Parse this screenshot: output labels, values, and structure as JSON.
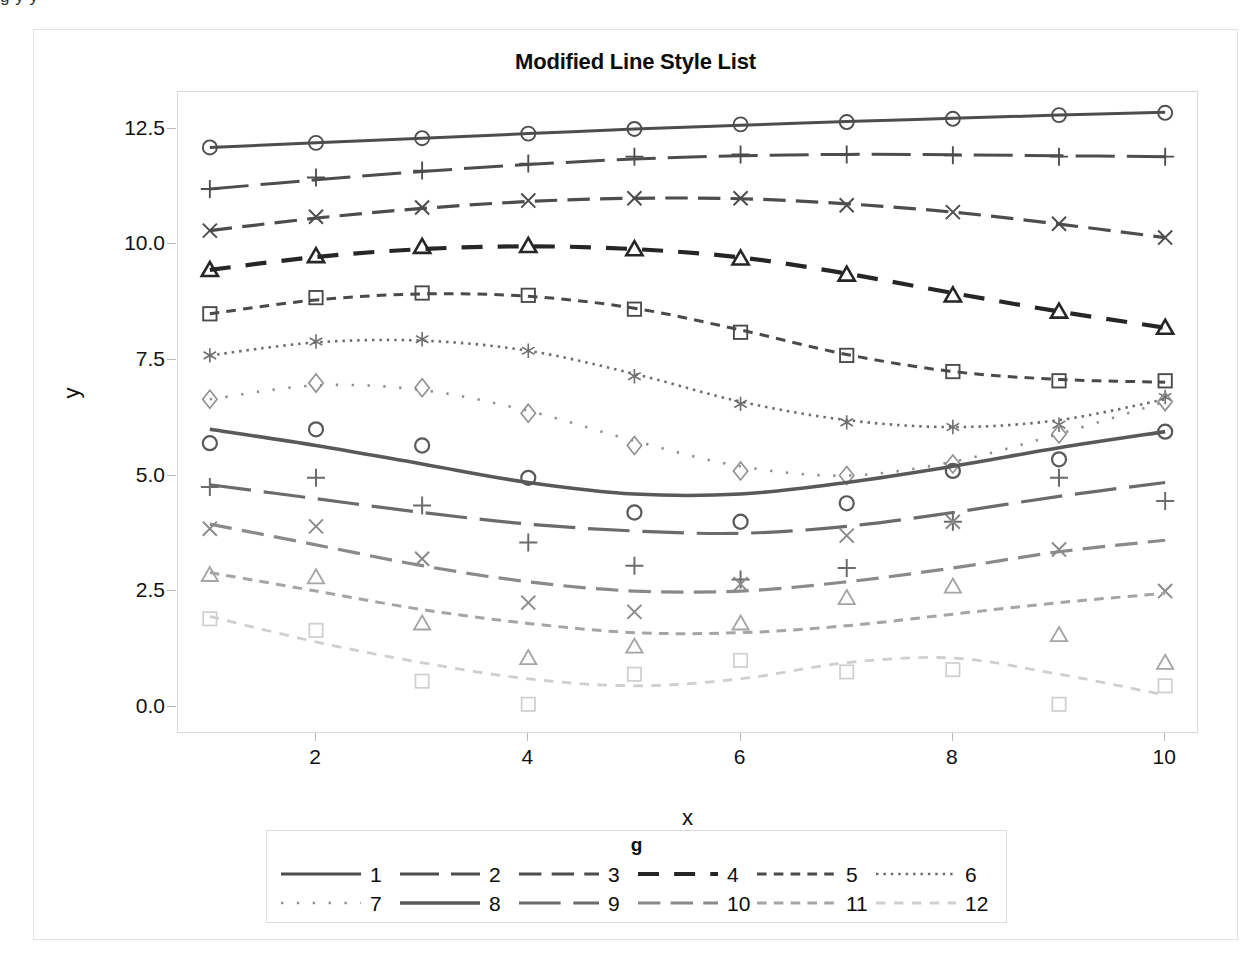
{
  "top_clipped_text": "g            y            y",
  "figure": {
    "title": "Modified Line Style List",
    "xlabel": "x",
    "ylabel": "y"
  },
  "legend": {
    "title": "g"
  },
  "chart_data": {
    "type": "line",
    "title": "Modified Line Style List",
    "xlabel": "x",
    "ylabel": "y",
    "xlim": [
      0.7,
      10.3
    ],
    "ylim": [
      -0.55,
      13.3
    ],
    "xticks": [
      2,
      4,
      6,
      8,
      10
    ],
    "yticks": [
      "0.0",
      "2.5",
      "5.0",
      "7.5",
      "10.0",
      "12.5"
    ],
    "ytick_values": [
      0.0,
      2.5,
      5.0,
      7.5,
      10.0,
      12.5
    ],
    "grid": false,
    "legend_position": "bottom",
    "legend_title": "g",
    "legend_columns": 6,
    "x": [
      1,
      2,
      3,
      4,
      5,
      6,
      7,
      8,
      9,
      10
    ],
    "series": [
      {
        "name": "1",
        "style": "solid",
        "marker": "circle",
        "color": "#4d4d4d",
        "width": 3.0,
        "values": [
          12.1,
          12.2,
          12.3,
          12.4,
          12.5,
          12.6,
          12.65,
          12.72,
          12.8,
          12.85
        ],
        "fit": [
          12.1,
          12.2,
          12.3,
          12.4,
          12.5,
          12.58,
          12.66,
          12.73,
          12.8,
          12.86
        ]
      },
      {
        "name": "2",
        "style": "longdash",
        "marker": "plus",
        "color": "#4d4d4d",
        "width": 3.0,
        "values": [
          11.2,
          11.45,
          11.6,
          11.75,
          11.9,
          11.95,
          11.95,
          11.93,
          11.9,
          11.9
        ],
        "fit": [
          11.2,
          11.4,
          11.58,
          11.73,
          11.85,
          11.92,
          11.95,
          11.94,
          11.92,
          11.9
        ]
      },
      {
        "name": "3",
        "style": "dash",
        "marker": "x",
        "color": "#4d4d4d",
        "width": 3.2,
        "values": [
          10.3,
          10.6,
          10.8,
          10.95,
          11.0,
          11.0,
          10.85,
          10.7,
          10.45,
          10.15
        ],
        "fit": [
          10.3,
          10.57,
          10.78,
          10.93,
          11.0,
          10.99,
          10.88,
          10.7,
          10.44,
          10.15
        ]
      },
      {
        "name": "4",
        "style": "dashlong",
        "marker": "triangle",
        "color": "#262626",
        "width": 4.2,
        "values": [
          9.45,
          9.75,
          9.95,
          9.97,
          9.9,
          9.7,
          9.35,
          8.9,
          8.55,
          8.2
        ],
        "fit": [
          9.45,
          9.73,
          9.9,
          9.96,
          9.9,
          9.72,
          9.37,
          8.95,
          8.55,
          8.2
        ]
      },
      {
        "name": "5",
        "style": "shortdash",
        "marker": "square",
        "color": "#4a4a4a",
        "width": 3.0,
        "values": [
          8.5,
          8.85,
          8.95,
          8.9,
          8.6,
          8.1,
          7.6,
          7.25,
          7.05,
          7.05
        ],
        "fit": [
          8.5,
          8.8,
          8.93,
          8.88,
          8.62,
          8.15,
          7.62,
          7.25,
          7.08,
          7.02
        ]
      },
      {
        "name": "6",
        "style": "dot",
        "marker": "asterisk",
        "color": "#6e6e6e",
        "width": 2.6,
        "values": [
          7.6,
          7.9,
          7.95,
          7.7,
          7.15,
          6.55,
          6.15,
          6.05,
          6.1,
          6.7
        ],
        "fit": [
          7.6,
          7.88,
          7.92,
          7.7,
          7.2,
          6.6,
          6.2,
          6.05,
          6.2,
          6.65
        ]
      },
      {
        "name": "7",
        "style": "sparsedot",
        "marker": "diamond",
        "color": "#8f8f8f",
        "width": 2.6,
        "values": [
          6.65,
          7.0,
          6.9,
          6.35,
          5.65,
          5.1,
          5.0,
          5.25,
          5.9,
          6.6
        ],
        "fit": [
          6.65,
          6.95,
          6.85,
          6.4,
          5.75,
          5.2,
          5.0,
          5.3,
          5.9,
          6.6
        ]
      },
      {
        "name": "8",
        "style": "solid",
        "marker": "circle",
        "color": "#595959",
        "width": 3.6,
        "values": [
          5.7,
          6.0,
          5.65,
          4.95,
          4.2,
          4.0,
          4.4,
          5.1,
          5.35,
          5.95
        ],
        "fit": [
          6.0,
          5.65,
          5.25,
          4.85,
          4.6,
          4.6,
          4.85,
          5.2,
          5.6,
          5.95
        ]
      },
      {
        "name": "9",
        "style": "longdash",
        "marker": "plus",
        "color": "#6b6b6b",
        "width": 3.2,
        "values": [
          4.75,
          4.95,
          4.35,
          3.55,
          3.05,
          2.75,
          3.0,
          4.0,
          4.95,
          4.45
        ],
        "fit": [
          4.8,
          4.5,
          4.2,
          3.95,
          3.8,
          3.75,
          3.9,
          4.2,
          4.55,
          4.85
        ]
      },
      {
        "name": "10",
        "style": "dash",
        "marker": "x",
        "color": "#8a8a8a",
        "width": 3.2,
        "values": [
          3.85,
          3.9,
          3.2,
          2.25,
          2.05,
          2.65,
          3.7,
          4.0,
          3.4,
          2.5
        ],
        "fit": [
          3.95,
          3.5,
          3.05,
          2.7,
          2.5,
          2.5,
          2.7,
          3.0,
          3.35,
          3.6
        ]
      },
      {
        "name": "11",
        "style": "shortdash",
        "marker": "triangle",
        "color": "#a5a5a5",
        "width": 3.0,
        "values": [
          2.85,
          2.8,
          1.8,
          1.05,
          1.3,
          1.8,
          2.35,
          2.6,
          1.55,
          0.95
        ],
        "fit": [
          2.9,
          2.5,
          2.1,
          1.8,
          1.6,
          1.6,
          1.75,
          2.0,
          2.25,
          2.45
        ]
      },
      {
        "name": "12",
        "style": "finedash",
        "marker": "square",
        "color": "#cfcfcf",
        "width": 2.8,
        "values": [
          1.9,
          1.65,
          0.55,
          0.05,
          0.7,
          1.0,
          0.75,
          0.8,
          0.05,
          0.45
        ],
        "fit": [
          1.95,
          1.4,
          0.95,
          0.6,
          0.45,
          0.6,
          0.95,
          1.05,
          0.7,
          0.25
        ]
      }
    ]
  }
}
